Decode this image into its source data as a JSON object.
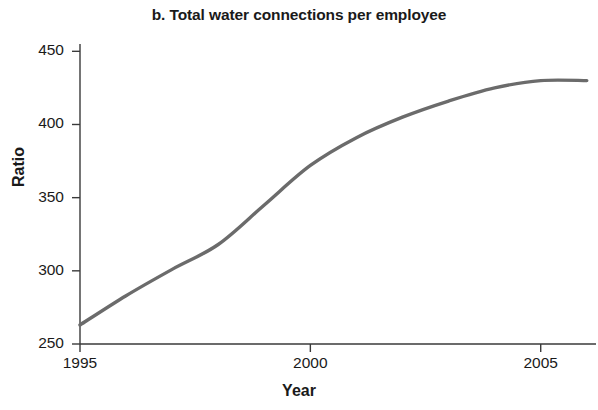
{
  "chart_data": {
    "type": "line",
    "title": "b. Total water connections per employee",
    "xlabel": "Year",
    "ylabel": "Ratio",
    "x": [
      1995,
      1996,
      1997,
      1998,
      1999,
      2000,
      2001,
      2002,
      2003,
      2004,
      2005,
      2006
    ],
    "values": [
      263,
      283,
      301,
      318,
      345,
      372,
      391,
      405,
      416,
      425,
      430,
      430
    ],
    "series": [
      {
        "name": "Total water connections per employee",
        "values": [
          263,
          283,
          301,
          318,
          345,
          372,
          391,
          405,
          416,
          425,
          430,
          430
        ]
      }
    ],
    "xlim": [
      1995,
      2006.2
    ],
    "ylim": [
      250,
      455
    ],
    "xticks": [
      1995,
      2000,
      2005
    ],
    "xtick_labels": [
      "1995",
      "2000",
      "2005"
    ],
    "yticks": [
      250,
      300,
      350,
      400,
      450
    ],
    "ytick_labels": [
      "250",
      "300",
      "350",
      "400",
      "450"
    ],
    "grid": false,
    "legend": false,
    "line_color": "#6b6b6b",
    "axis_color": "#3a3a3a",
    "background_color": "#ffffff"
  }
}
